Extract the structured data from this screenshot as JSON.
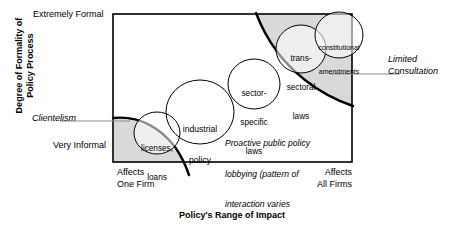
{
  "figure": {
    "type": "conceptual-matrix-diagram",
    "axes": {
      "y": {
        "title_line1": "Degree of Formality of",
        "title_line2": "Policy Process",
        "max_label": "Extremely Formal",
        "min_label": "Very Informal"
      },
      "x": {
        "title": "Policy's Range of Impact",
        "min_label_line1": "Affects",
        "min_label_line2": "One Firm",
        "max_label_line1": "Affects",
        "max_label_line2": "All Firms"
      }
    },
    "regions": [
      {
        "id": "clientelism",
        "label_line1": "Clientelism",
        "position": "lower-left",
        "shaded": true
      },
      {
        "id": "limited-consultation",
        "label_line1": "Limited",
        "label_line2": "Consultation",
        "position": "upper-right",
        "shaded": true
      }
    ],
    "bubbles": [
      {
        "id": "licenses-loans",
        "line1": "licenses,",
        "line2": "loans",
        "cx": 157,
        "cy": 133,
        "rx": 23,
        "ry": 21
      },
      {
        "id": "industrial-policy",
        "line1": "industrial",
        "line2": "policy",
        "cx": 200,
        "cy": 112,
        "rx": 34,
        "ry": 32
      },
      {
        "id": "sector-specific-laws",
        "line1": "sector-",
        "line2": "specific",
        "line3": "laws",
        "cx": 254,
        "cy": 84,
        "rx": 26,
        "ry": 25
      },
      {
        "id": "trans-sectoral-laws",
        "line1": "trans-",
        "line2": "sectoral",
        "line3": "laws",
        "cx": 301,
        "cy": 49,
        "rx": 25,
        "ry": 24
      },
      {
        "id": "constitutional-amendments",
        "line1": "constitutional",
        "line2": "amendments",
        "cx": 339,
        "cy": 35,
        "rx": 24,
        "ry": 23
      }
    ],
    "annotation": {
      "line1": "Proactive public policy",
      "line2": "lobbying (pattern of",
      "line3": "interaction varies",
      "line4": "by sector)"
    },
    "colors": {
      "shade_fill": "#d9d9d9",
      "line": "#000000",
      "background": "#ffffff",
      "leader": "#8c8c8c"
    }
  }
}
